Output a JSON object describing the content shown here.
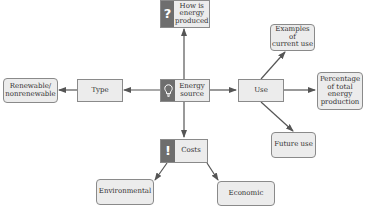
{
  "diagram": {
    "center": {
      "id": "energy_source",
      "label": "Energy source",
      "icon": "lightbulb-icon"
    },
    "nodes": {
      "how_produced": {
        "label": "How is energy produced",
        "line1": "How is",
        "line2": "energy",
        "line3": "produced",
        "icon": "question-mark-icon",
        "icon_glyph": "?"
      },
      "energy_source": {
        "line1": "Energy",
        "line2": "source",
        "icon": "lightbulb-icon"
      },
      "type": {
        "label": "Type"
      },
      "renewable": {
        "line1": "Renewable/",
        "line2": "nonrenewable"
      },
      "use": {
        "label": "Use"
      },
      "examples": {
        "line1": "Examples of",
        "line2": "current use"
      },
      "percentage": {
        "line1": "Percentage",
        "line2": "of total",
        "line3": "energy",
        "line4": "production"
      },
      "future_use": {
        "label": "Future use"
      },
      "costs": {
        "label": "Costs",
        "icon": "exclamation-icon",
        "icon_glyph": "!"
      },
      "environmental": {
        "label": "Environmental"
      },
      "economic": {
        "label": "Economic"
      }
    },
    "edges": [
      {
        "from": "Energy source",
        "to": "How is energy produced"
      },
      {
        "from": "Energy source",
        "to": "Type"
      },
      {
        "from": "Type",
        "to": "Renewable/nonrenewable"
      },
      {
        "from": "Energy source",
        "to": "Use"
      },
      {
        "from": "Use",
        "to": "Examples of current use"
      },
      {
        "from": "Use",
        "to": "Percentage of total energy production"
      },
      {
        "from": "Use",
        "to": "Future use"
      },
      {
        "from": "Energy source",
        "to": "Costs"
      },
      {
        "from": "Costs",
        "to": "Environmental"
      },
      {
        "from": "Costs",
        "to": "Economic"
      }
    ],
    "colors": {
      "node_fill": "#ececec",
      "node_border": "#8a8a8a",
      "icon_fill": "#6e6e6e",
      "edge": "#555555"
    }
  }
}
